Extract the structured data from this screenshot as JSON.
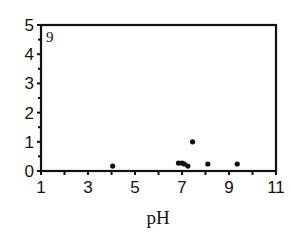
{
  "chart_data": {
    "type": "scatter",
    "title": "",
    "panel_label": "9",
    "xlabel": "pH",
    "ylabel": "",
    "xlim": [
      1,
      11
    ],
    "ylim": [
      0,
      5
    ],
    "xticks": [
      1,
      3,
      5,
      7,
      9,
      11
    ],
    "yticks": [
      0,
      1,
      2,
      3,
      4,
      5
    ],
    "grid": false,
    "legend": null,
    "series": [
      {
        "name": "points",
        "x": [
          4.05,
          6.85,
          7.0,
          7.1,
          7.25,
          7.45,
          8.1,
          9.35
        ],
        "y": [
          0.17,
          0.27,
          0.27,
          0.24,
          0.17,
          1.0,
          0.24,
          0.24
        ]
      }
    ]
  },
  "colors": {
    "axis": "#111111",
    "points": "#111111",
    "background": "#ffffff"
  }
}
